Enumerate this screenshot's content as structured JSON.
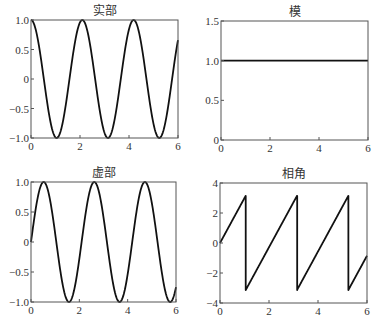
{
  "chart_data": [
    {
      "id": "real",
      "type": "line",
      "title": "实部",
      "xlabel": "",
      "ylabel": "",
      "xlim": [
        0,
        6
      ],
      "ylim": [
        -1.0,
        1.0
      ],
      "xticks": [
        "0",
        "2",
        "4",
        "6"
      ],
      "yticks": [
        "-1.0",
        "-0.5",
        "0",
        "0.5",
        "1.0"
      ],
      "grid": false,
      "function": "cos(3x)",
      "x": [
        0,
        0.5,
        1.0,
        1.047,
        1.5,
        2.0,
        2.094,
        2.5,
        3.0,
        3.142,
        3.5,
        4.0,
        4.189,
        4.5,
        5.0,
        5.236,
        5.5,
        6.0
      ],
      "values": [
        1.0,
        0.07,
        -0.99,
        -1.0,
        -0.21,
        0.96,
        1.0,
        0.35,
        -0.91,
        -1.0,
        -0.48,
        0.84,
        1.0,
        0.6,
        -0.76,
        -1.0,
        -0.7,
        0.66
      ]
    },
    {
      "id": "modulus",
      "type": "line",
      "title": "模",
      "xlabel": "",
      "ylabel": "",
      "xlim": [
        0,
        6
      ],
      "ylim": [
        0,
        1.5
      ],
      "xticks": [
        "0",
        "2",
        "4",
        "6"
      ],
      "yticks": [
        "0",
        "0.5",
        "1.0",
        "1.5"
      ],
      "grid": false,
      "function": "|e^(i3x)| = 1",
      "x": [
        0,
        6
      ],
      "values": [
        1.0,
        1.0
      ]
    },
    {
      "id": "imag",
      "type": "line",
      "title": "虚部",
      "xlabel": "",
      "ylabel": "",
      "xlim": [
        0,
        6
      ],
      "ylim": [
        -1.0,
        1.0
      ],
      "xticks": [
        "0",
        "2",
        "4",
        "6"
      ],
      "yticks": [
        "-1.0",
        "-0.5",
        "0",
        "0.5",
        "1.0"
      ],
      "grid": false,
      "function": "sin(3x)",
      "x": [
        0,
        0.524,
        1.0,
        1.571,
        2.0,
        2.618,
        3.0,
        3.665,
        4.0,
        4.712,
        5.0,
        5.76,
        6.0
      ],
      "values": [
        0,
        1.0,
        0.14,
        -1.0,
        -0.28,
        1.0,
        0.41,
        -1.0,
        -0.54,
        1.0,
        0.65,
        -1.0,
        -0.75
      ]
    },
    {
      "id": "phase",
      "type": "line",
      "title": "相角",
      "xlabel": "",
      "ylabel": "",
      "xlim": [
        0,
        6
      ],
      "ylim": [
        -4,
        4
      ],
      "xticks": [
        "0",
        "2",
        "4",
        "6"
      ],
      "yticks": [
        "-4",
        "-2",
        "0",
        "2",
        "4"
      ],
      "grid": false,
      "function": "angle(e^(i3x)) wrapped to [-pi, pi]",
      "x": [
        0,
        1.047,
        1.047,
        3.142,
        3.142,
        5.236,
        5.236,
        6.0
      ],
      "values": [
        0,
        3.14,
        -3.14,
        3.14,
        -3.14,
        3.14,
        -3.14,
        -0.85
      ]
    }
  ],
  "panels": {
    "real": {
      "title": "实部"
    },
    "modulus": {
      "title": "模"
    },
    "imag": {
      "title": "虚部"
    },
    "phase": {
      "title": "相角"
    }
  },
  "colors": {
    "line": "#111111",
    "frame": "#555555",
    "background": "#ffffff"
  }
}
